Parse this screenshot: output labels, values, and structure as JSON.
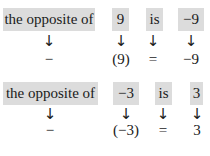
{
  "examples": [
    {
      "top": [
        "the opposite of",
        "9",
        "is",
        "−9"
      ],
      "arrow": "↓",
      "bottom": [
        "−",
        "(9)",
        "=",
        "−9"
      ]
    },
    {
      "top": [
        "the opposite of",
        "−3",
        "is",
        "3"
      ],
      "arrow": "↓",
      "bottom": [
        "−",
        "(−3)",
        "=",
        "3"
      ]
    }
  ],
  "colors": {
    "box_bg": "#dcdcdc",
    "text": "#1a1a1a"
  }
}
